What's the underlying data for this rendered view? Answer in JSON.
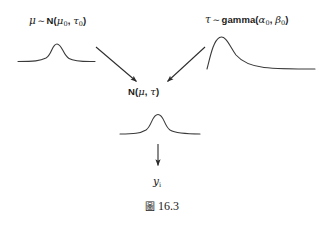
{
  "figure": {
    "caption_symbol": "圖",
    "caption_number": "16.3",
    "background_color": "#ffffff",
    "stroke_color": "#3a3a3a"
  },
  "nodes": {
    "mu_prior": {
      "name": "mu-prior",
      "variable": "μ",
      "tilde": "∼",
      "family": "N",
      "open": "(",
      "param1": "μ",
      "param1_sub": "0",
      "separator": ", ",
      "param2": "τ",
      "param2_sub": "0",
      "close": ")",
      "plain_text": "μ ∼ N(μ₀, τ₀)"
    },
    "tau_prior": {
      "name": "tau-prior",
      "variable": "τ",
      "tilde": "∼",
      "family": "gamma",
      "open": "(",
      "param1": "α",
      "param1_sub": "0",
      "separator": ", ",
      "param2": "β",
      "param2_sub": "0",
      "close": ")",
      "plain_text": "τ ∼ gamma(α₀, β₀)"
    },
    "likelihood": {
      "name": "likelihood",
      "family": "N",
      "open": "(",
      "param1": "μ",
      "separator": ", ",
      "param2": "τ",
      "close": ")",
      "plain_text": "N(μ, τ)"
    },
    "observation": {
      "name": "observation",
      "variable": "y",
      "variable_sub": "i",
      "plain_text": "yᵢ"
    }
  },
  "curves": {
    "mu_prior_curve": {
      "name": "normal-density-curve",
      "shape": "bell",
      "path": "M 18,61.5 C 34,61.5 40,61 46,58 C 52,54.5 52,44 57,44 C 62,44 63,55 69,58.5 C 75,62 84,61.5 95,61.5"
    },
    "tau_prior_curve": {
      "name": "gamma-density-curve",
      "shape": "right-skewed",
      "path": "M 207,69 C 210,58 213,41 219.5,37.5 C 226,34.5 230,47 236,55 C 243,63 252,66 264,67.5 C 278,69 298,69 315,69"
    },
    "likelihood_curve": {
      "name": "normal-density-curve",
      "shape": "bell",
      "path": "M 120,134 C 134,134 140,133.5 146,130 C 152,126 152,114.5 158,114.5 C 164,114.5 164,126 170,130 C 176,133.5 186,134 200,134"
    }
  },
  "arrows": {
    "mu_to_likelihood": {
      "name": "arrow-mu-to-likelihood",
      "from": [
        96,
        47
      ],
      "to": [
        138,
        83
      ],
      "direction": "down-right"
    },
    "tau_to_likelihood": {
      "name": "arrow-tau-to-likelihood",
      "from": [
        205,
        47
      ],
      "to": [
        166,
        83
      ],
      "direction": "down-left"
    },
    "likelihood_to_observation": {
      "name": "arrow-likelihood-to-observation",
      "from": [
        158,
        144
      ],
      "to": [
        158,
        167
      ],
      "direction": "down"
    }
  }
}
